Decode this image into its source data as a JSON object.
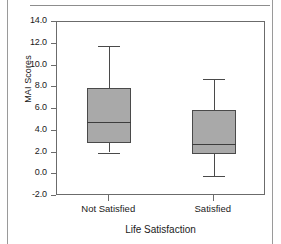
{
  "figure": {
    "y_axis_label": "MAI Scores",
    "x_axis_label": "Life Satisfaction"
  },
  "chart_data": {
    "type": "box",
    "title": "",
    "xlabel": "Life Satisfaction",
    "ylabel": "MAI Scores",
    "categories": [
      "Not Satisfied",
      "Satisfied"
    ],
    "ylim": [
      -2.0,
      14.0
    ],
    "ytick_labels": [
      "14.0",
      "12.0",
      "10.0",
      "8.0",
      "6.0",
      "4.0",
      "2.0",
      "0.0",
      "-2.0"
    ],
    "ytick_values": [
      14.0,
      12.0,
      10.0,
      8.0,
      6.0,
      4.0,
      2.0,
      0.0,
      -2.0
    ],
    "grid": false,
    "legend": false,
    "boxes": [
      {
        "category": "Not Satisfied",
        "whisker_low": 2.0,
        "q1": 2.9,
        "median": 4.8,
        "q3": 7.9,
        "whisker_high": 11.8
      },
      {
        "category": "Satisfied",
        "whisker_low": -0.2,
        "q1": 1.9,
        "median": 2.8,
        "q3": 5.9,
        "whisker_high": 8.8
      }
    ],
    "box_fill_color": "#a9a9a9",
    "box_edge_color": "#4a4a4a",
    "axis_color": "#6b6b6b"
  }
}
